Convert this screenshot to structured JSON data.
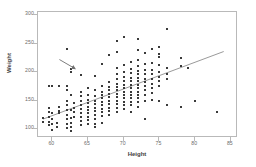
{
  "chart_data": {
    "type": "scatter",
    "title": "",
    "xlabel": "Height",
    "ylabel": "Weight",
    "xlim": [
      58,
      86
    ],
    "ylim": [
      85,
      305
    ],
    "xticks": [
      60,
      65,
      70,
      75,
      80,
      85
    ],
    "yticks": [
      100,
      150,
      200,
      250,
      300
    ],
    "grid": false,
    "legend": null,
    "marker_color": "#3a3a3a",
    "trendline_color": "#9a9a9a",
    "frame_color": "#b9b9b9",
    "tick_label_color": "#6d6d6d",
    "trendline": {
      "x": [
        58.7,
        84.0
      ],
      "y": [
        118,
        236
      ],
      "description": "least-squares regression line of Weight on Height"
    },
    "annotation_arrow": {
      "from": [
        61.0,
        222
      ],
      "to": [
        63.2,
        206
      ],
      "description": "arrow pointing at an outlier point near height 63, weight 205"
    },
    "points": [
      [
        58.7,
        120
      ],
      [
        58.7,
        113
      ],
      [
        59.6,
        175
      ],
      [
        59.6,
        138
      ],
      [
        59.6,
        130
      ],
      [
        59.6,
        122
      ],
      [
        59.6,
        113
      ],
      [
        59.6,
        107
      ],
      [
        60.0,
        175
      ],
      [
        60.0,
        128
      ],
      [
        60.0,
        118
      ],
      [
        60.0,
        110
      ],
      [
        60.0,
        99
      ],
      [
        60.6,
        112
      ],
      [
        60.6,
        104
      ],
      [
        61.0,
        176
      ],
      [
        61.0,
        140
      ],
      [
        61.0,
        133
      ],
      [
        61.0,
        128
      ],
      [
        62.0,
        240
      ],
      [
        62.0,
        175
      ],
      [
        62.0,
        168
      ],
      [
        62.0,
        150
      ],
      [
        62.0,
        142
      ],
      [
        62.0,
        134
      ],
      [
        62.0,
        126
      ],
      [
        62.0,
        118
      ],
      [
        62.0,
        110
      ],
      [
        62.0,
        102
      ],
      [
        62.6,
        205
      ],
      [
        62.6,
        200
      ],
      [
        62.6,
        160
      ],
      [
        62.6,
        134
      ],
      [
        62.6,
        120
      ],
      [
        62.6,
        112
      ],
      [
        62.6,
        104
      ],
      [
        62.6,
        98
      ],
      [
        63.0,
        146
      ],
      [
        63.0,
        138
      ],
      [
        63.0,
        130
      ],
      [
        63.0,
        122
      ],
      [
        64.0,
        195
      ],
      [
        64.0,
        166
      ],
      [
        64.0,
        158
      ],
      [
        64.0,
        150
      ],
      [
        64.0,
        143
      ],
      [
        64.0,
        136
      ],
      [
        64.0,
        129
      ],
      [
        64.0,
        122
      ],
      [
        64.0,
        115
      ],
      [
        64.0,
        108
      ],
      [
        65.0,
        172
      ],
      [
        65.0,
        160
      ],
      [
        65.0,
        152
      ],
      [
        65.0,
        146
      ],
      [
        65.0,
        140
      ],
      [
        65.0,
        134
      ],
      [
        65.0,
        128
      ],
      [
        65.0,
        122
      ],
      [
        65.0,
        116
      ],
      [
        65.0,
        110
      ],
      [
        66.0,
        193
      ],
      [
        66.0,
        168
      ],
      [
        66.0,
        158
      ],
      [
        66.0,
        150
      ],
      [
        66.0,
        144
      ],
      [
        66.0,
        138
      ],
      [
        66.0,
        132
      ],
      [
        66.0,
        126
      ],
      [
        66.0,
        118
      ],
      [
        66.0,
        110
      ],
      [
        66.0,
        104
      ],
      [
        67.0,
        215
      ],
      [
        67.0,
        176
      ],
      [
        67.0,
        166
      ],
      [
        67.0,
        160
      ],
      [
        67.0,
        154
      ],
      [
        67.0,
        148
      ],
      [
        67.0,
        142
      ],
      [
        67.0,
        136
      ],
      [
        67.0,
        130
      ],
      [
        67.0,
        124
      ],
      [
        67.0,
        112
      ],
      [
        68.0,
        230
      ],
      [
        68.0,
        182
      ],
      [
        68.0,
        174
      ],
      [
        68.0,
        168
      ],
      [
        68.0,
        162
      ],
      [
        68.0,
        156
      ],
      [
        68.0,
        150
      ],
      [
        68.0,
        144
      ],
      [
        68.0,
        138
      ],
      [
        68.0,
        132
      ],
      [
        68.0,
        126
      ],
      [
        69.0,
        255
      ],
      [
        69.0,
        235
      ],
      [
        69.0,
        208
      ],
      [
        69.0,
        196
      ],
      [
        69.0,
        188
      ],
      [
        69.0,
        180
      ],
      [
        69.0,
        174
      ],
      [
        69.0,
        168
      ],
      [
        69.0,
        162
      ],
      [
        69.0,
        156
      ],
      [
        69.0,
        150
      ],
      [
        69.0,
        144
      ],
      [
        69.0,
        138
      ],
      [
        69.0,
        130
      ],
      [
        70.0,
        262
      ],
      [
        70.0,
        212
      ],
      [
        70.0,
        200
      ],
      [
        70.0,
        192
      ],
      [
        70.0,
        184
      ],
      [
        70.0,
        178
      ],
      [
        70.0,
        172
      ],
      [
        70.0,
        166
      ],
      [
        70.0,
        160
      ],
      [
        70.0,
        154
      ],
      [
        70.0,
        148
      ],
      [
        70.0,
        142
      ],
      [
        70.0,
        136
      ],
      [
        71.0,
        218
      ],
      [
        71.0,
        206
      ],
      [
        71.0,
        198
      ],
      [
        71.0,
        190
      ],
      [
        71.0,
        184
      ],
      [
        71.0,
        178
      ],
      [
        71.0,
        172
      ],
      [
        71.0,
        166
      ],
      [
        71.0,
        160
      ],
      [
        71.0,
        154
      ],
      [
        71.0,
        148
      ],
      [
        71.0,
        142
      ],
      [
        71.0,
        130
      ],
      [
        72.0,
        258
      ],
      [
        72.0,
        238
      ],
      [
        72.0,
        222
      ],
      [
        72.0,
        210
      ],
      [
        72.0,
        202
      ],
      [
        72.0,
        196
      ],
      [
        72.0,
        190
      ],
      [
        72.0,
        184
      ],
      [
        72.0,
        178
      ],
      [
        72.0,
        172
      ],
      [
        72.0,
        166
      ],
      [
        72.0,
        160
      ],
      [
        72.0,
        154
      ],
      [
        72.0,
        148
      ],
      [
        72.0,
        140
      ],
      [
        73.0,
        234
      ],
      [
        73.0,
        214
      ],
      [
        73.0,
        204
      ],
      [
        73.0,
        196
      ],
      [
        73.0,
        188
      ],
      [
        73.0,
        182
      ],
      [
        73.0,
        176
      ],
      [
        73.0,
        168
      ],
      [
        73.0,
        160
      ],
      [
        73.0,
        150
      ],
      [
        73.0,
        118
      ],
      [
        74.0,
        240
      ],
      [
        74.0,
        216
      ],
      [
        74.0,
        204
      ],
      [
        74.0,
        196
      ],
      [
        74.0,
        188
      ],
      [
        74.0,
        180
      ],
      [
        74.0,
        172
      ],
      [
        74.0,
        164
      ],
      [
        74.0,
        152
      ],
      [
        75.0,
        244
      ],
      [
        75.0,
        232
      ],
      [
        75.0,
        226
      ],
      [
        75.0,
        212
      ],
      [
        75.0,
        200
      ],
      [
        75.0,
        192
      ],
      [
        75.0,
        184
      ],
      [
        75.0,
        176
      ],
      [
        75.0,
        150
      ],
      [
        76.0,
        275
      ],
      [
        76.0,
        208
      ],
      [
        76.0,
        196
      ],
      [
        76.0,
        188
      ],
      [
        76.0,
        142
      ],
      [
        78.0,
        224
      ],
      [
        78.0,
        210
      ],
      [
        78.0,
        140
      ],
      [
        79.0,
        208
      ],
      [
        80.0,
        150
      ],
      [
        83.0,
        130
      ]
    ]
  }
}
